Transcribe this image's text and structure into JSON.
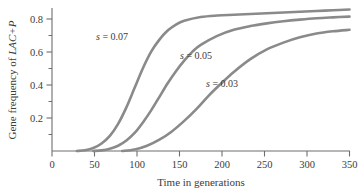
{
  "chart_data": {
    "type": "line",
    "title": "",
    "xlabel": "Time in generations",
    "ylabel": "Gene frequency of LAC+P",
    "ylabel_plain": "Gene frequency of ",
    "ylabel_italic": "LAC+P",
    "xlim": [
      0,
      360
    ],
    "ylim": [
      0,
      0.95
    ],
    "xticks": [
      0,
      50,
      100,
      150,
      200,
      250,
      300,
      350
    ],
    "xtick_labels": [
      "0",
      "50",
      "100",
      "150",
      "200",
      "250",
      "300",
      "350"
    ],
    "yticks": [
      0.2,
      0.4,
      0.6,
      0.8
    ],
    "ytick_labels": [
      "0.2",
      "0.4",
      "0.6",
      "0.8"
    ],
    "grid": false,
    "legend_position": "inline-annotations",
    "line_color": "#8a8a8a",
    "axis_color": "#6e6e6e",
    "series": [
      {
        "name": "s = 0.07",
        "label_prefix": "s",
        "label_eq": " = ",
        "label_value": "0.07",
        "x": [
          30,
          40,
          50,
          60,
          70,
          80,
          90,
          100,
          110,
          120,
          130,
          140,
          150,
          160,
          180,
          200,
          220,
          240,
          260,
          280,
          300,
          320,
          340,
          360
        ],
        "y": [
          0.0,
          0.005,
          0.02,
          0.05,
          0.1,
          0.18,
          0.29,
          0.42,
          0.55,
          0.66,
          0.74,
          0.8,
          0.84,
          0.865,
          0.89,
          0.9,
          0.905,
          0.91,
          0.915,
          0.92,
          0.925,
          0.93,
          0.935,
          0.94
        ]
      },
      {
        "name": "s = 0.05",
        "label_prefix": "s",
        "label_eq": " = ",
        "label_value": "0.05",
        "x": [
          50,
          60,
          70,
          80,
          90,
          100,
          110,
          120,
          130,
          140,
          150,
          160,
          170,
          180,
          200,
          220,
          240,
          260,
          280,
          300,
          320,
          340,
          360
        ],
        "y": [
          0.0,
          0.004,
          0.015,
          0.035,
          0.07,
          0.12,
          0.19,
          0.27,
          0.36,
          0.45,
          0.53,
          0.6,
          0.66,
          0.705,
          0.765,
          0.805,
          0.83,
          0.848,
          0.862,
          0.873,
          0.882,
          0.888,
          0.893
        ]
      },
      {
        "name": "s = 0.03",
        "label_prefix": "s",
        "label_eq": " = ",
        "label_value": "0.03",
        "x": [
          85,
          100,
          115,
          130,
          145,
          160,
          175,
          190,
          205,
          220,
          240,
          260,
          280,
          300,
          320,
          340,
          360
        ],
        "y": [
          0.0,
          0.01,
          0.035,
          0.075,
          0.13,
          0.2,
          0.28,
          0.37,
          0.45,
          0.525,
          0.61,
          0.675,
          0.72,
          0.755,
          0.78,
          0.795,
          0.805
        ]
      }
    ],
    "annotations": [
      {
        "text": "s = 0.07",
        "x_px": 112,
        "y_px": 40
      },
      {
        "text": "s = 0.05",
        "x_px": 196,
        "y_px": 59
      },
      {
        "text": "s = 0.03",
        "x_px": 222,
        "y_px": 87
      }
    ]
  }
}
